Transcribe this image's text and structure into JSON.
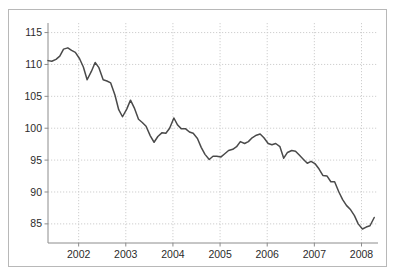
{
  "figure": {
    "background_color": "#ffffff",
    "border_color": "#b8b8b8",
    "line_color": "#4a4a4a",
    "grid_color": "#c9c9c9",
    "axis_color": "#8c8c8c",
    "tick_text_color": "#2b2b2b"
  },
  "chart_data": {
    "type": "line",
    "title": "",
    "subtitle": "",
    "xlabel": "",
    "ylabel": "",
    "xlim": [
      2001.35,
      2008.35
    ],
    "ylim": [
      82.0,
      116.5
    ],
    "yticks": [
      85,
      90,
      95,
      100,
      105,
      110,
      115
    ],
    "ytick_labels": [
      "85",
      "90",
      "95",
      "100",
      "105",
      "110",
      "115"
    ],
    "xticks": [
      2002,
      2003,
      2004,
      2005,
      2006,
      2007,
      2008
    ],
    "xtick_labels": [
      "2002",
      "2003",
      "2004",
      "2005",
      "2006",
      "2007",
      "2008"
    ],
    "grid": true,
    "grid_style": "dotted",
    "legend": false,
    "legend_position": "none",
    "series": [
      {
        "name": "index",
        "color": "#4a4a4a",
        "x": [
          2001.35,
          2001.43,
          2001.52,
          2001.6,
          2001.68,
          2001.77,
          2001.85,
          2001.93,
          2002.02,
          2002.1,
          2002.18,
          2002.27,
          2002.35,
          2002.43,
          2002.52,
          2002.6,
          2002.68,
          2002.77,
          2002.85,
          2002.93,
          2003.02,
          2003.1,
          2003.18,
          2003.27,
          2003.35,
          2003.43,
          2003.52,
          2003.6,
          2003.68,
          2003.77,
          2003.85,
          2003.93,
          2004.02,
          2004.1,
          2004.18,
          2004.27,
          2004.35,
          2004.43,
          2004.52,
          2004.6,
          2004.68,
          2004.77,
          2004.85,
          2004.93,
          2005.02,
          2005.1,
          2005.18,
          2005.27,
          2005.35,
          2005.43,
          2005.52,
          2005.6,
          2005.68,
          2005.77,
          2005.85,
          2005.93,
          2006.02,
          2006.1,
          2006.18,
          2006.27,
          2006.35,
          2006.43,
          2006.52,
          2006.6,
          2006.68,
          2006.77,
          2006.85,
          2006.93,
          2007.02,
          2007.1,
          2007.18,
          2007.27,
          2007.35,
          2007.43,
          2007.52,
          2007.6,
          2007.68,
          2007.77,
          2007.85,
          2007.93,
          2008.02,
          2008.1,
          2008.18,
          2008.27
        ],
        "values": [
          110.6,
          110.5,
          110.8,
          111.3,
          112.4,
          112.6,
          112.2,
          111.9,
          110.9,
          109.6,
          107.6,
          108.9,
          110.3,
          109.5,
          107.6,
          107.4,
          107.1,
          105.2,
          102.9,
          101.8,
          103.0,
          104.4,
          103.2,
          101.4,
          100.9,
          100.3,
          98.8,
          97.8,
          98.7,
          99.3,
          99.2,
          100.0,
          101.6,
          100.5,
          99.9,
          99.9,
          99.4,
          99.2,
          98.4,
          97.0,
          95.9,
          95.1,
          95.6,
          95.6,
          95.5,
          96.0,
          96.5,
          96.7,
          97.1,
          97.9,
          97.6,
          97.9,
          98.5,
          98.9,
          99.1,
          98.5,
          97.6,
          97.4,
          97.6,
          97.1,
          95.3,
          96.2,
          96.5,
          96.4,
          95.8,
          95.1,
          94.5,
          94.8,
          94.4,
          93.6,
          92.6,
          92.5,
          91.6,
          91.6,
          90.0,
          88.8,
          87.9,
          87.2,
          86.3,
          85.0,
          84.2,
          84.5,
          84.7,
          86.0
        ]
      }
    ]
  }
}
